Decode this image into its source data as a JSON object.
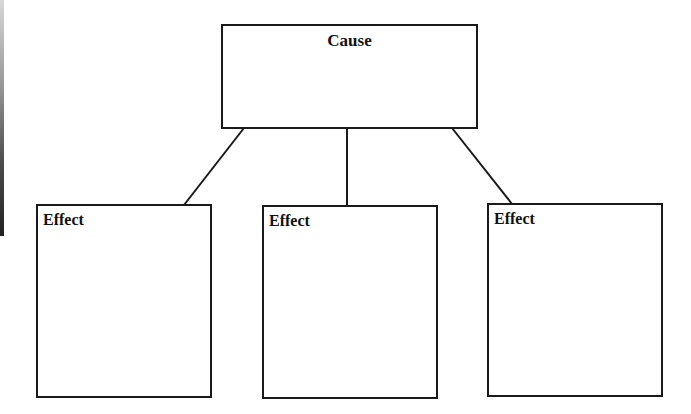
{
  "diagram": {
    "type": "cause-and-effect graphic organizer",
    "cause": {
      "label": "Cause"
    },
    "effects": [
      {
        "label": "Effect"
      },
      {
        "label": "Effect"
      },
      {
        "label": "Effect"
      }
    ],
    "colors": {
      "stroke": "#1a1a1a",
      "background": "#ffffff",
      "text": "#111111"
    }
  }
}
